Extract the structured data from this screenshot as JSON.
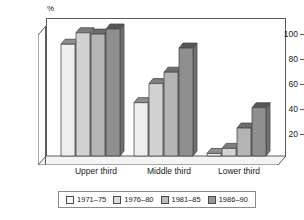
{
  "chart_data": {
    "type": "bar",
    "title": "",
    "subtitle": "",
    "xlabel": "",
    "ylabel": "%",
    "ylim": [
      0,
      110
    ],
    "yticks": [
      20,
      40,
      60,
      80,
      100
    ],
    "grid": false,
    "legend_position": "bottom",
    "style": "3d-column",
    "categories": [
      "Upper third",
      "Middle third",
      "Lower third"
    ],
    "series": [
      {
        "name": "1971–75",
        "color": "#eeeeee",
        "values": [
          88,
          42,
          2
        ]
      },
      {
        "name": "1976–80",
        "color": "#d2d2d2",
        "values": [
          97,
          57,
          6
        ]
      },
      {
        "name": "1981–85",
        "color": "#b4b4b4",
        "values": [
          96,
          66,
          22
        ]
      },
      {
        "name": "1986–90",
        "color": "#8f8f8f",
        "values": [
          100,
          85,
          38
        ]
      }
    ]
  },
  "axis": {
    "unit_label": "%",
    "tick_labels": [
      "100",
      "80",
      "60",
      "40",
      "20"
    ]
  },
  "categories": {
    "c0": "Upper third",
    "c1": "Middle third",
    "c2": "Lower third"
  },
  "legend": {
    "items": [
      {
        "label": "1971–75"
      },
      {
        "label": "1976–80"
      },
      {
        "label": "1981–85"
      },
      {
        "label": "1986–90"
      }
    ]
  },
  "colors": {
    "series1": "#eeeeee",
    "series2": "#d2d2d2",
    "series3": "#b4b4b4",
    "series4": "#8f8f8f",
    "frame": "#5a5a5a",
    "text": "#1a1a1a"
  }
}
